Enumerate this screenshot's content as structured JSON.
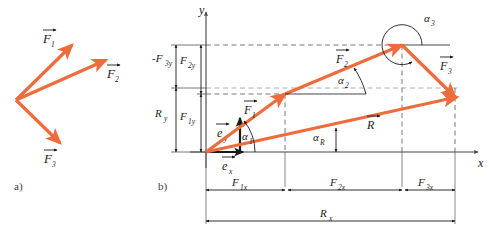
{
  "figure": {
    "panels": [
      {
        "id": "a",
        "label": "a)",
        "caption": "three concurrent force vectors"
      },
      {
        "id": "b",
        "label": "b)",
        "caption": "vector polygon with components"
      }
    ],
    "colors": {
      "vector": "#EE6B3B",
      "axis": "#444444",
      "dim": "#1a1a1a",
      "dashed": "#555555",
      "background": "#ffffff"
    }
  },
  "panel_a": {
    "label": "a)",
    "origin_label": "",
    "vectors": [
      {
        "name": "F1",
        "label": "F",
        "subscript": "1",
        "x1": 16,
        "y1": 100,
        "x2": 72,
        "y2": 45
      },
      {
        "name": "F2",
        "label": "F",
        "subscript": "2",
        "x1": 16,
        "y1": 100,
        "x2": 106,
        "y2": 60
      },
      {
        "name": "F3",
        "label": "F",
        "subscript": "3",
        "x1": 16,
        "y1": 100,
        "x2": 60,
        "y2": 143
      }
    ],
    "labels": [
      {
        "name": "F1-label",
        "text": "F",
        "sub": "1",
        "x": 44,
        "y": 42
      },
      {
        "name": "F2-label",
        "text": "F",
        "sub": "2",
        "x": 108,
        "y": 78
      },
      {
        "name": "F3-label",
        "text": "F",
        "sub": "3",
        "x": 45,
        "y": 162
      }
    ]
  },
  "panel_b": {
    "label": "b)",
    "axes": {
      "x_label": "x",
      "y_label": "y",
      "origin_x": 206,
      "origin_y": 152
    },
    "unit_vectors": [
      {
        "name": "e-x",
        "text": "e",
        "sub": "x"
      },
      {
        "name": "e-y",
        "text": "e",
        "sub": "y"
      }
    ],
    "vectors": [
      {
        "name": "F1",
        "text": "F",
        "sub": "1",
        "x1": 206,
        "y1": 152,
        "x2": 285,
        "y2": 94
      },
      {
        "name": "F2",
        "text": "F",
        "sub": "2",
        "x1": 285,
        "y1": 94,
        "x2": 402,
        "y2": 45
      },
      {
        "name": "F3",
        "text": "F",
        "sub": "3",
        "x1": 402,
        "y1": 45,
        "x2": 455,
        "y2": 97
      },
      {
        "name": "R",
        "text": "R",
        "sub": "",
        "x1": 206,
        "y1": 152,
        "x2": 455,
        "y2": 97
      }
    ],
    "angles": [
      {
        "name": "alpha-1",
        "text": "α",
        "sub": "1"
      },
      {
        "name": "alpha-2",
        "text": "α",
        "sub": "2"
      },
      {
        "name": "alpha-3",
        "text": "α",
        "sub": "3"
      },
      {
        "name": "alpha-R",
        "text": "α",
        "sub": "R"
      }
    ],
    "x_dimensions": [
      {
        "name": "F1x",
        "text": "F",
        "sub": "1x",
        "from": 206,
        "to": 285
      },
      {
        "name": "F2x",
        "text": "F",
        "sub": "2x",
        "from": 285,
        "to": 402
      },
      {
        "name": "F3x",
        "text": "F",
        "sub": "3x",
        "from": 402,
        "to": 455
      },
      {
        "name": "Rx",
        "text": "R",
        "sub": "x",
        "from": 206,
        "to": 455
      }
    ],
    "y_dimensions": [
      {
        "name": "neg-F3y",
        "text": "-F",
        "sub": "3y",
        "from": 45,
        "to": 88
      },
      {
        "name": "Ry",
        "text": "R",
        "sub": "y",
        "from": 88,
        "to": 152
      },
      {
        "name": "F2y",
        "text": "F",
        "sub": "2y",
        "from": 45,
        "to": 94
      },
      {
        "name": "F1y",
        "text": "F",
        "sub": "1y",
        "from": 94,
        "to": 152
      }
    ]
  }
}
